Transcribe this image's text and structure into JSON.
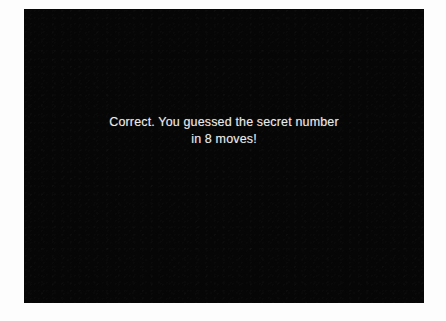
{
  "window": {
    "background_color": "#fdfdfd",
    "panel_background_color": "#060606",
    "text_color": "#e9e9e9"
  },
  "game": {
    "screen_name": "number-guessing-game-result",
    "message": {
      "line1": "Correct. You guessed the secret number",
      "line2": "in 8 moves!"
    },
    "result_status": "Correct.",
    "moves_count": "8"
  }
}
